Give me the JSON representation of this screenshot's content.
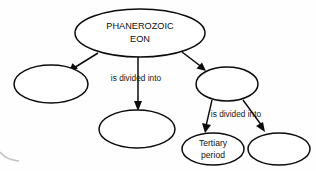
{
  "diagram": {
    "type": "concept-map",
    "background_color": "#fefefe",
    "stroke_color": "#0b0b0b",
    "text_color": "#101010",
    "nodes": [
      {
        "id": "phanerozoic-eon",
        "label_line1": "PHANEROZOIC",
        "label_line2": "EON",
        "cx": 140,
        "cy": 33,
        "rx": 65,
        "ry": 24,
        "stroke_width": 1.5,
        "font_size": 9.2,
        "empty": false
      },
      {
        "id": "era-left",
        "label_line1": "",
        "label_line2": "",
        "cx": 51,
        "cy": 84,
        "rx": 37,
        "ry": 19,
        "stroke_width": 1.5,
        "font_size": 8,
        "empty": true
      },
      {
        "id": "era-middle",
        "label_line1": "",
        "label_line2": "",
        "cx": 137,
        "cy": 129,
        "rx": 38,
        "ry": 19,
        "stroke_width": 1.5,
        "font_size": 8,
        "empty": true
      },
      {
        "id": "era-right",
        "label_line1": "",
        "label_line2": "",
        "cx": 227,
        "cy": 84,
        "rx": 31,
        "ry": 17,
        "stroke_width": 1.5,
        "font_size": 8,
        "empty": true
      },
      {
        "id": "tertiary-period",
        "label_line1": "Tertiary",
        "label_line2": "period",
        "cx": 213,
        "cy": 149,
        "rx": 31,
        "ry": 16,
        "stroke_width": 1.5,
        "font_size": 8.6,
        "empty": false
      },
      {
        "id": "period-right",
        "label_line1": "",
        "label_line2": "",
        "cx": 279,
        "cy": 149,
        "rx": 31,
        "ry": 16,
        "stroke_width": 1.5,
        "font_size": 8,
        "empty": true
      }
    ],
    "edges": [
      {
        "id": "eon-to-era-left",
        "from": "phanerozoic-eon",
        "to": "era-left",
        "path": "M 98 53 L 69 71",
        "arrow": "M 69 71 L 78 68.5 L 72.5 63.2 Z"
      },
      {
        "id": "eon-to-era-middle",
        "from": "phanerozoic-eon",
        "to": "era-middle",
        "path": "M 138 57 L 138 104",
        "arrow": "M 138 111 L 134 101 L 142 101 Z"
      },
      {
        "id": "eon-to-era-right",
        "from": "phanerozoic-eon",
        "to": "era-right",
        "path": "M 182 52 L 203 68",
        "arrow": "M 206 71 L 196.5 68.5 L 202 62.5 Z"
      },
      {
        "id": "era-right-to-tertiary",
        "from": "era-right",
        "to": "tertiary-period",
        "path": "M 212 100 L 206 126",
        "arrow": "M 205 133 L 202 123 L 211 125 Z"
      },
      {
        "id": "era-right-to-period-right",
        "from": "era-right",
        "to": "period-right",
        "path": "M 243 100 L 262 126",
        "arrow": "M 265 132 L 256 126 L 263 122 Z"
      }
    ],
    "edge_labels": [
      {
        "id": "label-eon-divided",
        "text": "is divided into",
        "x": 136,
        "y": 79,
        "font_size": 8.3
      },
      {
        "id": "label-era-divided",
        "text": "is divided into",
        "x": 236,
        "y": 115,
        "font_size": 8.3
      }
    ],
    "artifacts": [
      {
        "id": "scan-edge-artifact",
        "path": "M 0 152 Q 6 160 19 161"
      }
    ]
  }
}
